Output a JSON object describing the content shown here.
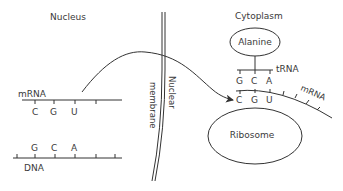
{
  "diagram": {
    "regions": {
      "nucleus": "Nucleus",
      "cytoplasm": "Cytoplasm"
    },
    "membrane": {
      "label_line1": "Nuclear",
      "label_line2": "membrane"
    },
    "nucleus_mrna": {
      "label": "mRNA",
      "bases": [
        "C",
        "G",
        "U"
      ]
    },
    "dna": {
      "label": "DNA",
      "bases": [
        "G",
        "C",
        "A"
      ]
    },
    "trna": {
      "label": "tRNA",
      "amino_acid": "Alanine",
      "anticodon": [
        "G",
        "C",
        "A"
      ]
    },
    "cytoplasm_mrna": {
      "label": "mRNA",
      "codon": [
        "C",
        "G",
        "U"
      ]
    },
    "ribosome": {
      "label": "Ribosome"
    },
    "arrow": {
      "meaning": "mRNA moves from nucleus to cytoplasm"
    }
  }
}
